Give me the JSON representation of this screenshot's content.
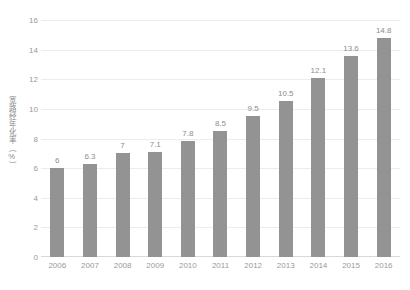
{
  "chart_data": {
    "type": "bar",
    "title": "",
    "xlabel": "",
    "ylabel": "宽路经年化率（%）",
    "categories": [
      "2006",
      "2007",
      "2008",
      "2009",
      "2010",
      "2011",
      "2012",
      "2013",
      "2014",
      "2015",
      "2016"
    ],
    "values": [
      6,
      6.3,
      7,
      7.1,
      7.8,
      8.5,
      9.5,
      10.5,
      12.1,
      13.6,
      14.8
    ],
    "value_labels": [
      "6",
      "6.3",
      "7",
      "7.1",
      "7.8",
      "8.5",
      "9.5",
      "10.5",
      "12.1",
      "13.6",
      "14.8"
    ],
    "ylim": [
      0,
      16
    ],
    "ytick_values": [
      0,
      2,
      4,
      6,
      8,
      10,
      12,
      14,
      16
    ],
    "ytick_labels": [
      "0",
      "2",
      "4",
      "6",
      "8",
      "10",
      "12",
      "14",
      "16"
    ],
    "grid": true,
    "grid_axis": "y",
    "legend": false,
    "legend_position": "none",
    "data_labels": true,
    "colors": {
      "bar": "#939393",
      "gridline": "#ececec",
      "baseline": "#d9d9d9",
      "tick_text": "#9a9a9a",
      "label_text": "#8e8e8e",
      "axis_title_text": "#8a8a8a",
      "background": "#ffffff"
    }
  }
}
